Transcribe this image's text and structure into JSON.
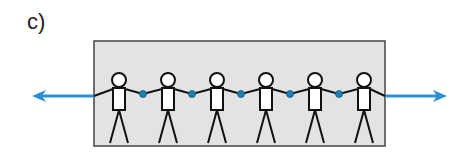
{
  "label": "c)",
  "diagram": {
    "figure_count": 6,
    "figure_x": [
      119,
      168,
      217,
      266,
      315,
      364
    ],
    "hand_links": [
      143,
      192,
      241,
      290,
      339
    ],
    "colors": {
      "box_fill": "#e3e3e3",
      "box_border": "#444444",
      "arrow": "#2a8fd6",
      "hand_dot": "#1f7fb0",
      "line": "#111111"
    },
    "arrows": [
      {
        "direction": "left",
        "from_x": 94,
        "to_x": 32,
        "y": 96
      },
      {
        "direction": "right",
        "from_x": 385,
        "to_x": 447,
        "y": 96
      }
    ]
  }
}
